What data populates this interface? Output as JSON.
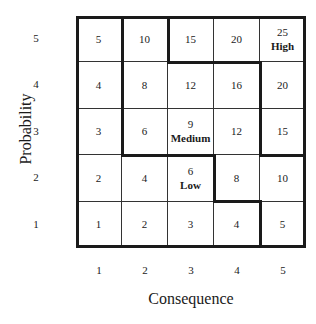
{
  "chart_data": {
    "type": "heatmap",
    "title": "",
    "xlabel": "Consequence",
    "ylabel": "Probability",
    "x_ticks": [
      "1",
      "2",
      "3",
      "4",
      "5"
    ],
    "y_ticks": [
      "5",
      "4",
      "3",
      "2",
      "1"
    ],
    "rows": [
      {
        "probability": 5,
        "values": [
          "5",
          "10",
          "15",
          "20",
          "25"
        ],
        "labels": [
          "",
          "",
          "",
          "",
          "High"
        ]
      },
      {
        "probability": 4,
        "values": [
          "4",
          "8",
          "12",
          "16",
          "20"
        ],
        "labels": [
          "",
          "",
          "",
          "",
          ""
        ]
      },
      {
        "probability": 3,
        "values": [
          "3",
          "6",
          "9",
          "12",
          "15"
        ],
        "labels": [
          "",
          "",
          "Medium",
          "",
          ""
        ]
      },
      {
        "probability": 2,
        "values": [
          "2",
          "4",
          "6",
          "8",
          "10"
        ],
        "labels": [
          "",
          "",
          "Low",
          "",
          ""
        ]
      },
      {
        "probability": 1,
        "values": [
          "1",
          "2",
          "3",
          "4",
          "5"
        ],
        "labels": [
          "",
          "",
          "",
          "",
          ""
        ]
      }
    ],
    "zones": [
      "Low",
      "Medium",
      "High"
    ]
  }
}
